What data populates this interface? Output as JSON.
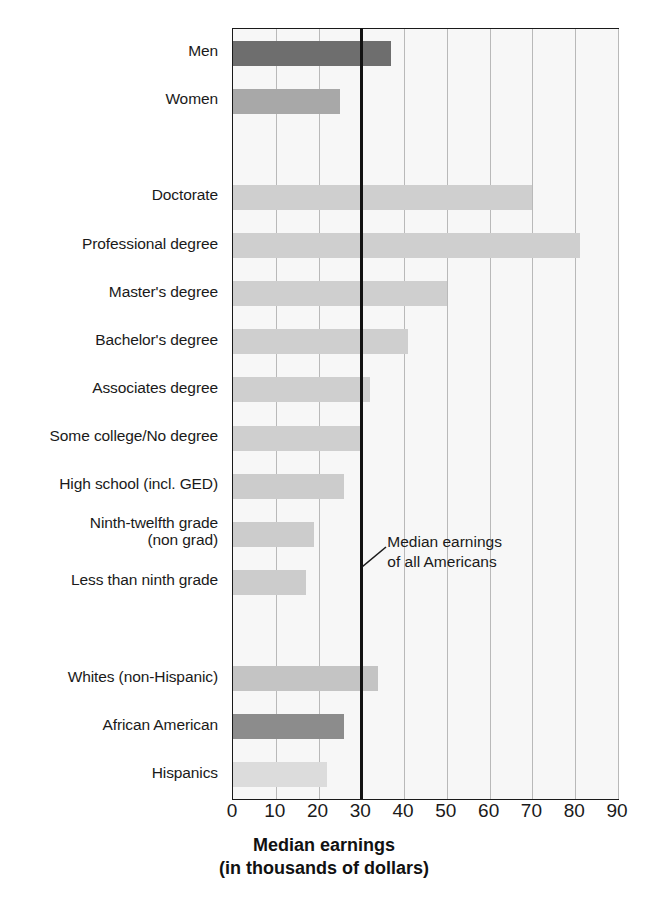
{
  "chart_data": {
    "type": "bar",
    "orientation": "horizontal",
    "title": "",
    "xlabel": "Median earnings\n(in thousands of dollars)",
    "xlabel_line1": "Median earnings",
    "xlabel_line2": "(in thousands of dollars)",
    "ylabel": "",
    "xlim": [
      0,
      90
    ],
    "xticks": [
      0,
      10,
      20,
      30,
      40,
      50,
      60,
      70,
      80,
      90
    ],
    "xtick_labels": [
      "0",
      "10",
      "20",
      "30",
      "40",
      "50",
      "60",
      "70",
      "80",
      "90"
    ],
    "grid": "vertical",
    "legend": "none",
    "units": "thousands of dollars",
    "categories": [
      "Men",
      "Women",
      "Doctorate",
      "Professional degree",
      "Master's degree",
      "Bachelor's degree",
      "Associates degree",
      "Some college/No degree",
      "High school (incl. GED)",
      "Ninth-twelfth grade\n(non grad)",
      "Less than ninth grade",
      "Whites (non-Hispanic)",
      "African American",
      "Hispanics"
    ],
    "values": [
      37,
      25,
      70,
      81,
      50,
      41,
      32,
      30,
      26,
      19,
      17,
      34,
      26,
      22
    ],
    "groups": [
      {
        "name": "Gender",
        "categories": [
          "Men",
          "Women"
        ]
      },
      {
        "name": "Educational attainment",
        "categories": [
          "Doctorate",
          "Professional degree",
          "Master's degree",
          "Bachelor's degree",
          "Associates degree",
          "Some college/No degree",
          "High school (incl. GED)",
          "Ninth-twelfth grade (non grad)",
          "Less than ninth grade"
        ]
      },
      {
        "name": "Race / ethnicity",
        "categories": [
          "Whites (non-Hispanic)",
          "African American",
          "Hispanics"
        ]
      }
    ],
    "bars": [
      {
        "label": "Men",
        "value": 37,
        "color": "#6e6e6e",
        "row": 0
      },
      {
        "label": "Women",
        "value": 25,
        "color": "#a8a8a8",
        "row": 1
      },
      {
        "label": "Doctorate",
        "value": 70,
        "color": "#cfcfcf",
        "row": 3
      },
      {
        "label": "Professional degree",
        "value": 81,
        "color": "#cfcfcf",
        "row": 4
      },
      {
        "label": "Master's degree",
        "value": 50,
        "color": "#cfcfcf",
        "row": 5
      },
      {
        "label": "Bachelor's degree",
        "value": 41,
        "color": "#cfcfcf",
        "row": 6
      },
      {
        "label": "Associates degree",
        "value": 32,
        "color": "#cfcfcf",
        "row": 7
      },
      {
        "label": "Some college/No degree",
        "value": 30,
        "color": "#cfcfcf",
        "row": 8
      },
      {
        "label": "High school (incl. GED)",
        "value": 26,
        "color": "#cccccc",
        "row": 9
      },
      {
        "label": "Ninth-twelfth grade (non grad)",
        "value": 19,
        "color": "#cccccc",
        "row": 10
      },
      {
        "label": "Less than ninth grade",
        "value": 17,
        "color": "#cccccc",
        "row": 11
      },
      {
        "label": "Whites (non-Hispanic)",
        "value": 34,
        "color": "#c4c4c4",
        "row": 13
      },
      {
        "label": "African American",
        "value": 26,
        "color": "#8c8c8c",
        "row": 14
      },
      {
        "label": "Hispanics",
        "value": 22,
        "color": "#dcdcdc",
        "row": 15
      }
    ],
    "reference_line": {
      "value": 30,
      "label": "Median earnings\nof all Americans",
      "label_line1": "Median earnings",
      "label_line2": "of all Americans",
      "color": "#121212"
    },
    "annotations": [
      {
        "text": "Median earnings\nof all Americans",
        "x": 30,
        "kind": "reference-line-callout"
      }
    ],
    "colors": {
      "dark_gray": "#6e6e6e",
      "medium_gray": "#a8a8a8",
      "light_gray": "#cfcfcf",
      "plot_background": "#f7f7f7",
      "gridline": "#b9b9b9",
      "axis": "#1a1a1a"
    }
  }
}
